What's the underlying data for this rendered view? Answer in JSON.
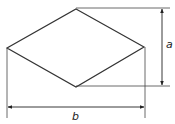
{
  "figure": {
    "shape": "rhombus",
    "labels": {
      "height": "a",
      "width": "b"
    },
    "colors": {
      "line": "#333333",
      "background": "#ffffff"
    }
  }
}
